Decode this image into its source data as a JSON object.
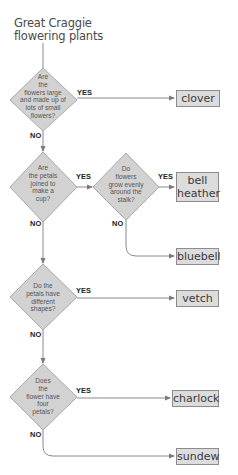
{
  "diagram": {
    "title": "Great Craggie\nflowering plants",
    "colors": {
      "diamond_fill": "#d2d2d2",
      "diamond_stroke": "#a8a8a8",
      "line": "#8a8a8a",
      "box_fill": "#dcdcdc",
      "box_stroke": "#8c8c8c",
      "text": "#3a3a3a"
    },
    "questions": [
      {
        "id": "q1",
        "text": "Are\nthe\nflowers large\nand made up of\nlots of small\nflowers?"
      },
      {
        "id": "q2",
        "text": "Are\nthe petals\njoined to\nmake a\ncup?"
      },
      {
        "id": "q3",
        "text": "Do\nflowers\ngrow evenly\naround the\nstalk?"
      },
      {
        "id": "q4",
        "text": "Do the\npetals have\ndifferent\nshapes?"
      },
      {
        "id": "q5",
        "text": "Does\nthe\nflower have\nfour\npetals?"
      }
    ],
    "answers": [
      {
        "id": "clover",
        "text": "clover"
      },
      {
        "id": "bell-heather",
        "text": "bell\nheather"
      },
      {
        "id": "bluebell",
        "text": "bluebell"
      },
      {
        "id": "vetch",
        "text": "vetch"
      },
      {
        "id": "charlock",
        "text": "charlock"
      },
      {
        "id": "sundew",
        "text": "sundew"
      }
    ],
    "labels": {
      "yes": "YES",
      "no": "NO"
    }
  }
}
